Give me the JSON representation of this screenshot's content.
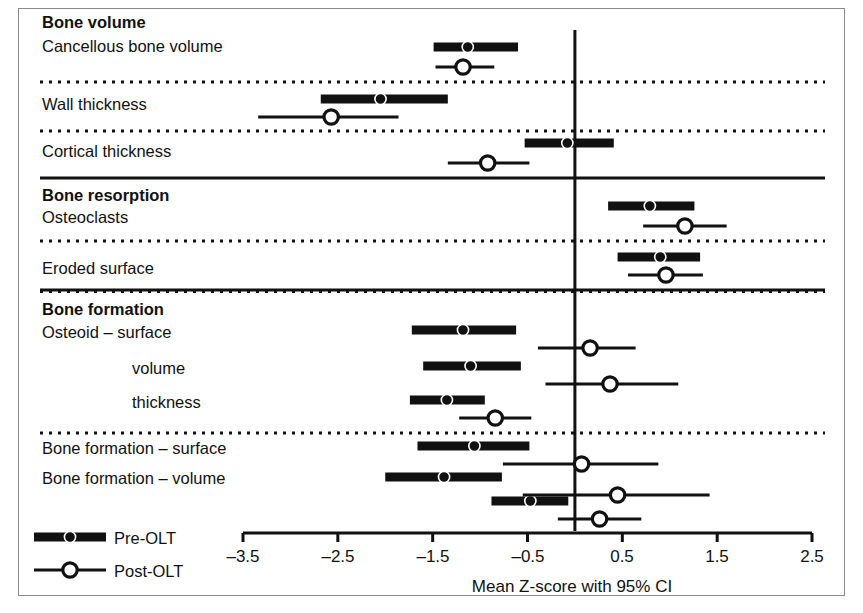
{
  "chart_data": {
    "type": "scatter",
    "title": "",
    "xlabel": "Mean Z-score with 95% CI",
    "ylabel": "",
    "xlim": [
      -3.5,
      2.5
    ],
    "xticks": [
      -3.5,
      -2.5,
      -1.5,
      -0.5,
      0.5,
      1.5,
      2.5
    ],
    "xtick_labels": [
      "–3.5",
      "–2.5",
      "–1.5",
      "–0.5",
      "0.5",
      "1.5",
      "2.5"
    ],
    "grid": false,
    "reference_line": 0,
    "legend_position": "bottom-left",
    "legend": [
      {
        "name": "Pre-OLT",
        "marker": "filled-circle",
        "line": "thick"
      },
      {
        "name": "Post-OLT",
        "marker": "open-circle",
        "line": "thin"
      }
    ],
    "series": [
      {
        "name": "Pre-OLT",
        "values": [
          -1.13,
          -2.05,
          -0.08,
          0.79,
          0.9,
          -1.18,
          -1.1,
          -1.35,
          -1.06,
          -1.38,
          -0.47
        ],
        "ci_low": [
          -1.49,
          -2.68,
          -0.53,
          0.35,
          0.45,
          -1.72,
          -1.6,
          -1.74,
          -1.66,
          -2.0,
          -0.88
        ],
        "ci_high": [
          -0.6,
          -1.34,
          0.41,
          1.26,
          1.32,
          -0.62,
          -0.57,
          -0.95,
          -0.48,
          -0.77,
          -0.07
        ]
      },
      {
        "name": "Post-OLT",
        "values": [
          -1.18,
          -2.57,
          -0.92,
          1.16,
          0.96,
          0.16,
          0.37,
          -0.84,
          0.07,
          0.45,
          0.26
        ],
        "ci_low": [
          -1.47,
          -3.34,
          -1.34,
          0.72,
          0.56,
          -0.39,
          -0.31,
          -1.22,
          -0.76,
          -0.55,
          -0.18
        ],
        "ci_high": [
          -0.85,
          -1.86,
          -0.48,
          1.6,
          1.35,
          0.64,
          1.09,
          -0.46,
          0.88,
          1.42,
          0.7
        ]
      }
    ],
    "categories": [
      "Cancellous bone volume",
      "Wall thickness",
      "Cortical thickness",
      "Osteoclasts",
      "Eroded surface",
      "Osteoid – surface",
      "volume",
      "thickness",
      "Bone formation – surface",
      "Bone formation – volume",
      ""
    ]
  },
  "sections": [
    {
      "heading": "Bone volume"
    },
    {
      "heading": "Bone resorption"
    },
    {
      "heading": "Bone formation"
    }
  ],
  "labels": {
    "bone_volume": "Bone volume",
    "cancellous_bone_volume": "Cancellous bone volume",
    "wall_thickness": "Wall thickness",
    "cortical_thickness": "Cortical thickness",
    "bone_resorption": "Bone resorption",
    "osteoclasts": "Osteoclasts",
    "eroded_surface": "Eroded surface",
    "bone_formation": "Bone formation",
    "osteoid_surface": "Osteoid – surface",
    "osteoid_volume": "volume",
    "osteoid_thickness": "thickness",
    "bone_formation_surface": "Bone formation – surface",
    "bone_formation_volume": "Bone formation – volume"
  },
  "legend": {
    "pre_olt": "Pre-OLT",
    "post_olt": "Post-OLT"
  },
  "axis": {
    "title": "Mean Z-score with 95% CI",
    "ticks": [
      "–3.5",
      "–2.5",
      "–1.5",
      "–0.5",
      "0.5",
      "1.5",
      "2.5"
    ]
  },
  "colors": {
    "ink": "#111111",
    "frame": "#8a8a8a",
    "background": "#ffffff"
  }
}
